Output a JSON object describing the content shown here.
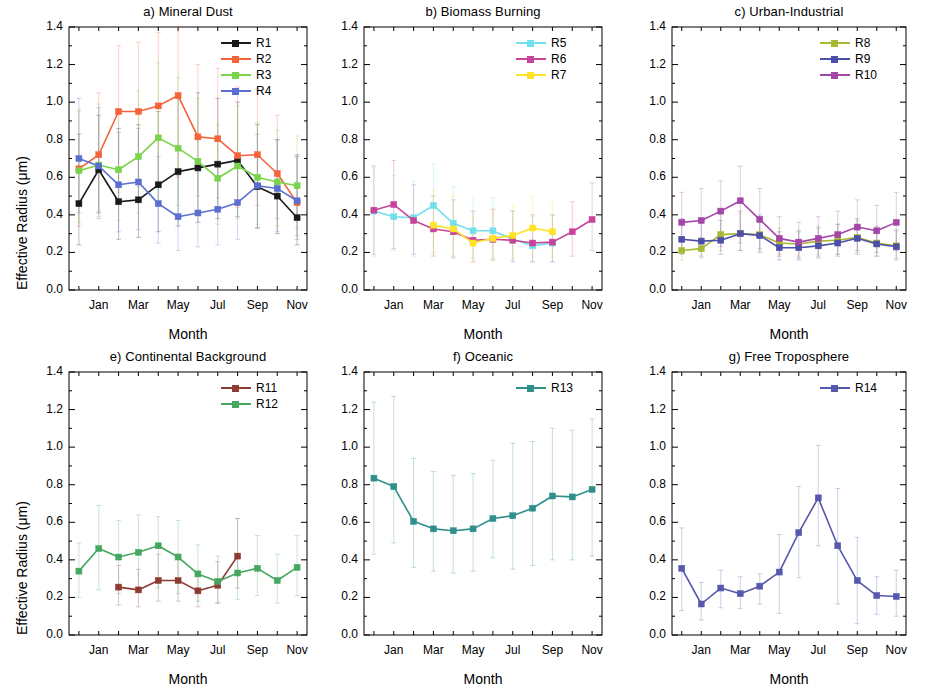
{
  "figure": {
    "ylabel": "Effective Radius  (μm)",
    "xlabel": "Month",
    "yticks": [
      "0.0",
      "0.2",
      "0.4",
      "0.6",
      "0.8",
      "1.0",
      "1.2",
      "1.4"
    ],
    "xticks": [
      "Jan",
      "Mar",
      "May",
      "Jul",
      "Sep",
      "Nov"
    ]
  },
  "chart_data": [
    {
      "type": "line",
      "panel": "a",
      "title": "a)  Mineral Dust",
      "xlabel": "Month",
      "ylabel": "Effective Radius  (μm)",
      "ylim": [
        0.0,
        1.4
      ],
      "grid": false,
      "legend_position": "top-right",
      "categories": [
        "Dec",
        "Jan",
        "Feb",
        "Mar",
        "Apr",
        "May",
        "Jun",
        "Jul",
        "Aug",
        "Sep",
        "Oct",
        "Nov"
      ],
      "xtick_labels": [
        "Jan",
        "Mar",
        "May",
        "Jul",
        "Sep",
        "Nov"
      ],
      "series": [
        {
          "name": "R1",
          "color": "#1a1a1a",
          "values": [
            0.46,
            0.64,
            0.47,
            0.48,
            0.56,
            0.63,
            0.65,
            0.67,
            0.69,
            0.55,
            0.5,
            0.385
          ],
          "err_low": [
            0.24,
            0.41,
            0.27,
            0.28,
            0.31,
            0.34,
            0.36,
            0.38,
            0.39,
            0.33,
            0.3,
            0.24
          ],
          "err_high": [
            0.83,
            0.93,
            0.86,
            0.88,
            0.95,
            1.02,
            1.05,
            1.02,
            1.0,
            0.88,
            0.8,
            0.71
          ]
        },
        {
          "name": "R2",
          "color": "#f4633a",
          "values": [
            0.645,
            0.72,
            0.95,
            0.95,
            0.98,
            1.035,
            0.815,
            0.805,
            0.715,
            0.72,
            0.62,
            0.465
          ],
          "err_low": [
            0.34,
            0.42,
            0.52,
            0.55,
            0.57,
            0.6,
            0.5,
            0.49,
            0.44,
            0.45,
            0.38,
            0.29
          ],
          "err_high": [
            0.96,
            1.05,
            1.3,
            1.32,
            1.37,
            1.4,
            1.2,
            1.18,
            1.08,
            1.07,
            0.93,
            0.72
          ]
        },
        {
          "name": "R3",
          "color": "#79d44b",
          "values": [
            0.635,
            0.665,
            0.64,
            0.71,
            0.81,
            0.755,
            0.685,
            0.595,
            0.66,
            0.6,
            0.575,
            0.555
          ],
          "err_low": [
            0.36,
            0.39,
            0.37,
            0.41,
            0.47,
            0.45,
            0.41,
            0.35,
            0.38,
            0.35,
            0.34,
            0.33
          ],
          "err_high": [
            0.95,
            0.99,
            0.96,
            1.06,
            1.21,
            1.13,
            1.02,
            0.88,
            0.98,
            0.89,
            0.85,
            0.82
          ]
        },
        {
          "name": "R4",
          "color": "#5a6fd0",
          "values": [
            0.7,
            0.66,
            0.56,
            0.575,
            0.46,
            0.39,
            0.41,
            0.43,
            0.465,
            0.555,
            0.54,
            0.475
          ],
          "err_low": [
            0.41,
            0.38,
            0.31,
            0.32,
            0.25,
            0.21,
            0.23,
            0.24,
            0.27,
            0.33,
            0.31,
            0.27
          ],
          "err_high": [
            1.02,
            0.97,
            0.84,
            0.86,
            0.71,
            0.61,
            0.63,
            0.66,
            0.71,
            0.83,
            0.8,
            0.72
          ]
        }
      ]
    },
    {
      "type": "line",
      "panel": "b",
      "title": "b) Biomass Burning",
      "xlabel": "Month",
      "ylabel": "",
      "ylim": [
        0.0,
        1.4
      ],
      "grid": false,
      "legend_position": "top-right",
      "categories": [
        "Dec",
        "Jan",
        "Feb",
        "Mar",
        "Apr",
        "May",
        "Jun",
        "Jul",
        "Aug",
        "Sep",
        "Oct",
        "Nov"
      ],
      "xtick_labels": [
        "Jan",
        "Mar",
        "May",
        "Jul",
        "Sep",
        "Nov"
      ],
      "series": [
        {
          "name": "R5",
          "color": "#72e0ec",
          "values": [
            0.42,
            0.39,
            0.385,
            0.45,
            0.355,
            0.315,
            0.315,
            0.27,
            0.235,
            0.25,
            null,
            null
          ],
          "err_low": [
            0.18,
            0.21,
            0.18,
            0.2,
            0.18,
            0.17,
            0.17,
            0.16,
            0.15,
            0.15,
            null,
            null
          ],
          "err_high": [
            0.65,
            0.61,
            0.58,
            0.67,
            0.55,
            0.49,
            0.49,
            0.42,
            0.39,
            0.4,
            null,
            null
          ]
        },
        {
          "name": "R6",
          "color": "#c8449a",
          "values": [
            0.425,
            0.455,
            0.37,
            0.325,
            0.31,
            0.265,
            0.27,
            0.265,
            0.25,
            0.255,
            0.31,
            0.375
          ],
          "err_low": [
            0.19,
            0.22,
            0.19,
            0.18,
            0.17,
            0.15,
            0.16,
            0.15,
            0.15,
            0.15,
            0.18,
            0.21
          ],
          "err_high": [
            0.66,
            0.69,
            0.56,
            0.5,
            0.48,
            0.42,
            0.43,
            0.42,
            0.4,
            0.4,
            0.47,
            0.57
          ]
        },
        {
          "name": "R7",
          "color": "#ffe324",
          "values": [
            null,
            null,
            null,
            0.345,
            0.325,
            0.25,
            0.275,
            0.29,
            0.33,
            0.31,
            null,
            null
          ],
          "err_low": [
            null,
            null,
            null,
            0.19,
            0.18,
            0.15,
            0.16,
            0.17,
            0.19,
            0.18,
            null,
            null
          ],
          "err_high": [
            null,
            null,
            null,
            0.53,
            0.5,
            0.39,
            0.43,
            0.45,
            0.5,
            0.47,
            null,
            null
          ]
        }
      ]
    },
    {
      "type": "line",
      "panel": "c",
      "title": "c) Urban-Industrial",
      "xlabel": "Month",
      "ylabel": "",
      "ylim": [
        0.0,
        1.4
      ],
      "grid": false,
      "legend_position": "top-right",
      "categories": [
        "Dec",
        "Jan",
        "Feb",
        "Mar",
        "Apr",
        "May",
        "Jun",
        "Jul",
        "Aug",
        "Sep",
        "Oct",
        "Nov"
      ],
      "xtick_labels": [
        "Jan",
        "Mar",
        "May",
        "Jul",
        "Sep",
        "Nov"
      ],
      "series": [
        {
          "name": "R8",
          "color": "#a8b832",
          "values": [
            0.21,
            0.22,
            0.295,
            0.3,
            0.295,
            0.25,
            0.245,
            0.26,
            0.265,
            0.28,
            0.25,
            0.235
          ],
          "err_low": [
            0.16,
            0.17,
            0.21,
            0.21,
            0.21,
            0.19,
            0.18,
            0.19,
            0.19,
            0.2,
            0.18,
            0.17
          ],
          "err_high": [
            0.27,
            0.28,
            0.4,
            0.41,
            0.39,
            0.33,
            0.32,
            0.34,
            0.35,
            0.37,
            0.33,
            0.31
          ]
        },
        {
          "name": "R9",
          "color": "#4c4fa8",
          "values": [
            0.27,
            0.26,
            0.265,
            0.3,
            0.29,
            0.225,
            0.225,
            0.235,
            0.25,
            0.275,
            0.245,
            0.23
          ],
          "err_low": [
            0.19,
            0.18,
            0.19,
            0.21,
            0.2,
            0.16,
            0.16,
            0.17,
            0.18,
            0.19,
            0.18,
            0.16
          ],
          "err_high": [
            0.38,
            0.37,
            0.37,
            0.42,
            0.4,
            0.31,
            0.31,
            0.33,
            0.35,
            0.38,
            0.34,
            0.32
          ]
        },
        {
          "name": "R10",
          "color": "#a346a8",
          "values": [
            0.36,
            0.37,
            0.42,
            0.475,
            0.375,
            0.275,
            0.255,
            0.275,
            0.295,
            0.335,
            0.315,
            0.36
          ],
          "err_low": [
            0.21,
            0.21,
            0.23,
            0.25,
            0.22,
            0.18,
            0.17,
            0.18,
            0.19,
            0.21,
            0.2,
            0.21
          ],
          "err_high": [
            0.52,
            0.54,
            0.58,
            0.66,
            0.54,
            0.39,
            0.36,
            0.39,
            0.42,
            0.48,
            0.45,
            0.52
          ]
        }
      ]
    },
    {
      "type": "line",
      "panel": "e",
      "title": "e) Continental Background",
      "xlabel": "Month",
      "ylabel": "Effective Radius  (μm)",
      "ylim": [
        0.0,
        1.4
      ],
      "grid": false,
      "legend_position": "top-right",
      "categories": [
        "Dec",
        "Jan",
        "Feb",
        "Mar",
        "Apr",
        "May",
        "Jun",
        "Jul",
        "Aug",
        "Sep",
        "Oct",
        "Nov"
      ],
      "xtick_labels": [
        "Jan",
        "Mar",
        "May",
        "Jul",
        "Sep",
        "Nov"
      ],
      "series": [
        {
          "name": "R11",
          "color": "#8e3b34",
          "values": [
            null,
            null,
            0.255,
            0.24,
            0.29,
            0.29,
            0.235,
            0.265,
            0.42,
            null,
            null,
            null
          ],
          "err_low": [
            null,
            null,
            0.16,
            0.15,
            0.18,
            0.18,
            0.15,
            0.17,
            0.25,
            null,
            null,
            null
          ],
          "err_high": [
            null,
            null,
            0.37,
            0.35,
            0.43,
            0.43,
            0.34,
            0.39,
            0.62,
            null,
            null,
            null
          ]
        },
        {
          "name": "R12",
          "color": "#46a85e",
          "values": [
            0.34,
            0.46,
            0.415,
            0.44,
            0.475,
            0.415,
            0.325,
            0.285,
            0.33,
            0.355,
            0.29,
            0.36
          ],
          "err_low": [
            0.2,
            0.24,
            0.22,
            0.23,
            0.25,
            0.22,
            0.18,
            0.17,
            0.19,
            0.21,
            0.17,
            0.21
          ],
          "err_high": [
            0.49,
            0.69,
            0.61,
            0.64,
            0.63,
            0.61,
            0.48,
            0.42,
            0.62,
            0.53,
            0.43,
            0.53
          ]
        }
      ]
    },
    {
      "type": "line",
      "panel": "f",
      "title": "f) Oceanic",
      "xlabel": "Month",
      "ylabel": "",
      "ylim": [
        0.0,
        1.4
      ],
      "grid": false,
      "legend_position": "top-right",
      "categories": [
        "Dec",
        "Jan",
        "Feb",
        "Mar",
        "Apr",
        "May",
        "Jun",
        "Jul",
        "Aug",
        "Sep",
        "Oct",
        "Nov"
      ],
      "xtick_labels": [
        "Jan",
        "Mar",
        "May",
        "Jul",
        "Sep",
        "Nov"
      ],
      "series": [
        {
          "name": "R13",
          "color": "#2f8f8a",
          "values": [
            0.835,
            0.79,
            0.605,
            0.565,
            0.555,
            0.565,
            0.62,
            0.635,
            0.675,
            0.74,
            0.735,
            0.775
          ],
          "err_low": [
            0.43,
            0.49,
            0.36,
            0.34,
            0.33,
            0.34,
            0.41,
            0.35,
            0.37,
            0.4,
            0.4,
            0.42
          ],
          "err_high": [
            1.24,
            1.27,
            0.94,
            0.87,
            0.85,
            0.86,
            0.93,
            1.02,
            1.03,
            1.1,
            1.09,
            1.15
          ]
        }
      ]
    },
    {
      "type": "line",
      "panel": "g",
      "title": "g) Free Troposphere",
      "xlabel": "Month",
      "ylabel": "",
      "ylim": [
        0.0,
        1.4
      ],
      "grid": false,
      "legend_position": "top-right",
      "categories": [
        "Dec",
        "Jan",
        "Feb",
        "Mar",
        "Apr",
        "May",
        "Jun",
        "Jul",
        "Aug",
        "Sep",
        "Oct",
        "Nov"
      ],
      "xtick_labels": [
        "Jan",
        "Mar",
        "May",
        "Jul",
        "Sep",
        "Nov"
      ],
      "series": [
        {
          "name": "R14",
          "color": "#5558ad",
          "values": [
            0.355,
            0.165,
            0.25,
            0.22,
            0.26,
            0.335,
            0.545,
            0.73,
            0.475,
            0.29,
            0.21,
            0.205
          ],
          "err_low": [
            0.13,
            0.08,
            0.145,
            0.14,
            0.165,
            0.115,
            0.305,
            0.475,
            0.165,
            0.06,
            0.11,
            0.1
          ],
          "err_high": [
            0.57,
            0.28,
            0.345,
            0.31,
            0.325,
            0.535,
            0.79,
            1.01,
            0.78,
            0.52,
            0.31,
            0.345
          ]
        }
      ]
    }
  ]
}
